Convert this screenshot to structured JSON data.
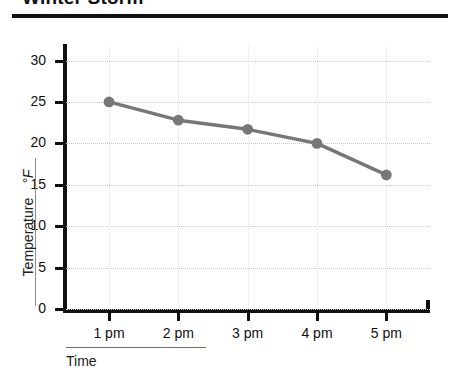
{
  "title": "Winter Storm",
  "axes": {
    "ylabel_name": "Temperature",
    "ylabel_unit": "°F",
    "xlabel": "Time"
  },
  "chart_data": {
    "type": "line",
    "title": "Winter Storm",
    "xlabel": "Time",
    "ylabel": "Temperature °F",
    "categories": [
      "1 pm",
      "2 pm",
      "3 pm",
      "4 pm",
      "5 pm"
    ],
    "values": [
      25,
      22.8,
      21.7,
      20,
      16.2
    ],
    "ylim": [
      0,
      32
    ],
    "yticks": [
      0,
      5,
      10,
      15,
      20,
      25,
      30
    ],
    "ytick_labels": [
      "0",
      "5",
      "10",
      "15",
      "20",
      "25",
      "30"
    ],
    "grid": true,
    "legend": "none",
    "series_color": "#777777",
    "marker": "circle"
  }
}
